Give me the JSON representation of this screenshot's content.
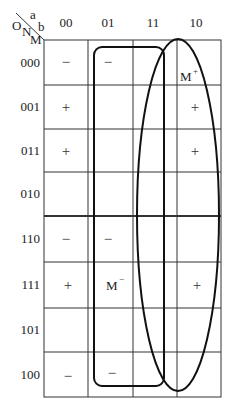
{
  "corner": {
    "o": "O",
    "a": "a",
    "n": "N",
    "b": "b",
    "m": "M"
  },
  "columns": [
    "00",
    "01",
    "11",
    "10"
  ],
  "rows": [
    "000",
    "001",
    "011",
    "010",
    "110",
    "111",
    "101",
    "100"
  ],
  "cells": [
    [
      "−",
      "−",
      "",
      "M"
    ],
    [
      "+",
      "",
      "",
      "+"
    ],
    [
      "+",
      "",
      "",
      "+"
    ],
    [
      "",
      "",
      "",
      ""
    ],
    [
      "−",
      "−",
      "",
      ""
    ],
    [
      "+",
      "M",
      "",
      "+"
    ],
    [
      "",
      "",
      "",
      ""
    ],
    [
      "−",
      "−",
      "",
      ""
    ]
  ],
  "superscripts": {
    "m_plus": "+",
    "m_minus": "−"
  }
}
